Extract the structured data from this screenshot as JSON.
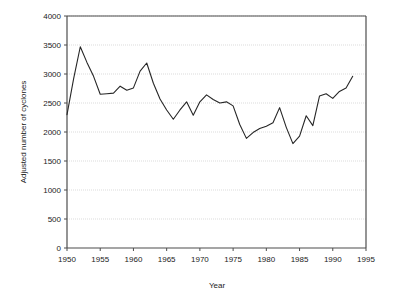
{
  "chart_data": {
    "type": "line",
    "title": "",
    "xlabel": "Year",
    "ylabel": "Adjusted number of cyclones",
    "xlim": [
      1950,
      1995
    ],
    "ylim": [
      0,
      4000
    ],
    "grid": true,
    "grid_axis": "y",
    "legend": "none",
    "line_color": "#262626",
    "axis_color": "#4d4d4d",
    "grid_color": "#cccccc",
    "background_color": "#ffffff",
    "xticks": [
      1950,
      1955,
      1960,
      1965,
      1970,
      1975,
      1980,
      1985,
      1990,
      1995
    ],
    "xtick_labels": [
      "1950",
      "1955",
      "1960",
      "1965",
      "1970",
      "1975",
      "1980",
      "1985",
      "1990",
      "1995"
    ],
    "yticks": [
      0,
      500,
      1000,
      1500,
      2000,
      2500,
      3000,
      3500,
      4000
    ],
    "ytick_labels": [
      "0",
      "500",
      "1000",
      "1500",
      "2000",
      "2500",
      "3000",
      "3500",
      "4000"
    ],
    "series": [
      {
        "name": "Adjusted number of cyclones",
        "x": [
          1950,
          1951,
          1952,
          1953,
          1954,
          1955,
          1956,
          1957,
          1958,
          1959,
          1960,
          1961,
          1962,
          1963,
          1964,
          1965,
          1966,
          1967,
          1968,
          1969,
          1970,
          1971,
          1972,
          1973,
          1974,
          1975,
          1976,
          1977,
          1978,
          1979,
          1980,
          1981,
          1982,
          1983,
          1984,
          1985,
          1986,
          1987,
          1988,
          1989,
          1990,
          1991,
          1992,
          1993
        ],
        "values": [
          2300,
          2920,
          3470,
          3200,
          2960,
          2650,
          2660,
          2670,
          2790,
          2720,
          2760,
          3050,
          3190,
          2840,
          2570,
          2380,
          2220,
          2380,
          2520,
          2290,
          2520,
          2640,
          2560,
          2500,
          2520,
          2450,
          2130,
          1890,
          1990,
          2060,
          2100,
          2160,
          2420,
          2080,
          1800,
          1930,
          2280,
          2110,
          2620,
          2660,
          2580,
          2700,
          2760,
          2960
        ]
      }
    ]
  }
}
